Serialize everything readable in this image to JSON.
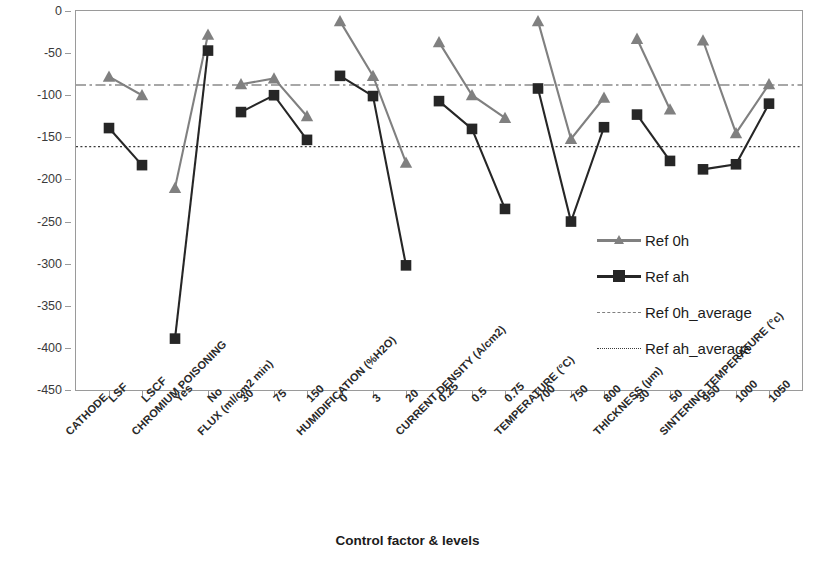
{
  "axes": {
    "ylabel": "Average effect for ΔV/500h (mV/500h)",
    "xlabel": "Control factor & levels",
    "ytick_labels": [
      "0",
      "-50",
      "-100",
      "-150",
      "-200",
      "-250",
      "-300",
      "-350",
      "-400",
      "-450"
    ]
  },
  "legend": {
    "items": [
      {
        "label": "Ref 0h",
        "marker": "triangle-marker",
        "style": "solid",
        "color": "#808080"
      },
      {
        "label": "Ref ah",
        "marker": "square-marker",
        "style": "solid",
        "color": "#262626"
      },
      {
        "label": "Ref 0h_average",
        "marker": "no-marker",
        "style": "dash-dot",
        "color": "#808080"
      },
      {
        "label": "Ref ah_average",
        "marker": "no-marker",
        "style": "dotted",
        "color": "#3a3a3a"
      }
    ]
  },
  "chart_data": {
    "type": "line",
    "title": "",
    "xlabel": "Control factor & levels",
    "ylabel": "Average effect for ΔV/500h (mV/500h)",
    "ylim": [
      -450,
      0
    ],
    "ytick_step": 50,
    "grid": false,
    "legend_position": "inside-right",
    "categories": [
      "CATHODE: LSF",
      "CATHODE: LSCF",
      "CHROMIUM POISONING: Yes",
      "CHROMIUM POISONING: No",
      "FLUX (ml/cm2 min): 30",
      "FLUX (ml/cm2 min): 75",
      "FLUX (ml/cm2 min): 150",
      "HUMIDIFICATION (%H2O): 0",
      "HUMIDIFICATION (%H2O): 3",
      "HUMIDIFICATION (%H2O): 20",
      "CURRENT DENSITY (A/cm2): 0.25",
      "CURRENT DENSITY (A/cm2): 0.5",
      "CURRENT DENSITY (A/cm2): 0.75",
      "TEMPERATURE (°C): 700",
      "TEMPERATURE (°C): 750",
      "TEMPERATURE (°C): 800",
      "THICKNESS (μm): 30",
      "THICKNESS (μm): 50",
      "SINTERING TEMPERATURE (°c): 950",
      "SINTERING TEMPERATURE (°c): 1000",
      "SINTERING TEMPERATURE (°c): 1050"
    ],
    "factors": [
      {
        "name": "CATHODE",
        "levels": [
          "LSF",
          "LSCF"
        ]
      },
      {
        "name": "CHROMIUM POISONING",
        "levels": [
          "Yes",
          "No"
        ]
      },
      {
        "name": "FLUX (ml/cm2 min)",
        "levels": [
          "30",
          "75",
          "150"
        ]
      },
      {
        "name": "HUMIDIFICATION (%H2O)",
        "levels": [
          "0",
          "3",
          "20"
        ]
      },
      {
        "name": "CURRENT DENSITY (A/cm2)",
        "levels": [
          "0.25",
          "0.5",
          "0.75"
        ]
      },
      {
        "name": "TEMPERATURE (°C)",
        "levels": [
          "700",
          "750",
          "800"
        ]
      },
      {
        "name": "THICKNESS (μm)",
        "levels": [
          "30",
          "50"
        ]
      },
      {
        "name": "SINTERING TEMPERATURE (°c)",
        "levels": [
          "950",
          "1000",
          "1050"
        ]
      }
    ],
    "series": [
      {
        "name": "Ref 0h",
        "color": "#808080",
        "marker": "triangle",
        "segments": [
          {
            "factor": "CATHODE",
            "values": [
              -78,
              -100
            ]
          },
          {
            "factor": "CHROMIUM POISONING",
            "values": [
              -210,
              -28
            ]
          },
          {
            "factor": "FLUX (ml/cm2 min)",
            "values": [
              -87,
              -80,
              -125
            ]
          },
          {
            "factor": "HUMIDIFICATION (%H2O)",
            "values": [
              -12,
              -77,
              -180
            ]
          },
          {
            "factor": "CURRENT DENSITY (A/cm2)",
            "values": [
              -37,
              -100,
              -127
            ]
          },
          {
            "factor": "TEMPERATURE (°C)",
            "values": [
              -12,
              -152,
              -103
            ]
          },
          {
            "factor": "THICKNESS (μm)",
            "values": [
              -33,
              -117
            ]
          },
          {
            "factor": "SINTERING TEMPERATURE (°c)",
            "values": [
              -35,
              -145,
              -87
            ]
          }
        ]
      },
      {
        "name": "Ref ah",
        "color": "#262626",
        "marker": "square",
        "segments": [
          {
            "factor": "CATHODE",
            "values": [
              -139,
              -183
            ]
          },
          {
            "factor": "CHROMIUM POISONING",
            "values": [
              -389,
              -47
            ]
          },
          {
            "factor": "FLUX (ml/cm2 min)",
            "values": [
              -120,
              -100,
              -153
            ]
          },
          {
            "factor": "HUMIDIFICATION (%H2O)",
            "values": [
              -77,
              -101,
              -302
            ]
          },
          {
            "factor": "CURRENT DENSITY (A/cm2)",
            "values": [
              -107,
              -140,
              -235
            ]
          },
          {
            "factor": "TEMPERATURE (°C)",
            "values": [
              -92,
              -250,
              -138
            ]
          },
          {
            "factor": "THICKNESS (μm)",
            "values": [
              -123,
              -178
            ]
          },
          {
            "factor": "SINTERING TEMPERATURE (°c)",
            "values": [
              -188,
              -182,
              -110
            ]
          }
        ]
      }
    ],
    "reference_lines": [
      {
        "name": "Ref 0h_average",
        "value": -88,
        "style": "dash-dot",
        "color": "#8a8a8a"
      },
      {
        "name": "Ref ah_average",
        "value": -161,
        "style": "dotted",
        "color": "#3a3a3a"
      }
    ]
  }
}
